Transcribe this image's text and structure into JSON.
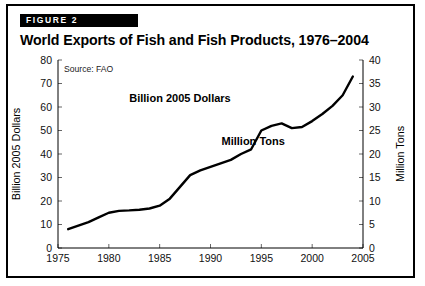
{
  "figure": {
    "badge": "FIGURE 2",
    "title": "World Exports of Fish and Fish Products, 1976–2004",
    "source": "Source: FAO"
  },
  "chart_data": {
    "type": "line",
    "title": "World Exports of Fish and Fish Products, 1976–2004",
    "subtitle": "Source: FAO",
    "xlabel": "",
    "ylabel": "Billion 2005 Dollars",
    "y2label": "Million Tons",
    "xlim": [
      1975,
      2005
    ],
    "ylim": [
      0,
      80
    ],
    "y2lim": [
      0,
      40
    ],
    "xticks": [
      1975,
      1980,
      1985,
      1990,
      1995,
      2000,
      2005
    ],
    "yticks": [
      0,
      10,
      20,
      30,
      40,
      50,
      60,
      70,
      80
    ],
    "y2ticks": [
      0,
      5,
      10,
      15,
      20,
      25,
      30,
      35,
      40
    ],
    "grid": false,
    "legend": "none",
    "annotations": [
      {
        "text": "Billion 2005 Dollars",
        "x": 1987.0,
        "y": 62.0
      },
      {
        "text": "Million Tons",
        "x": 1994.2,
        "y": 44.0
      }
    ],
    "series": [
      {
        "name": "World exports of fish and fish products",
        "units": "Billion 2005 Dollars",
        "x": [
          1976,
          1977,
          1978,
          1979,
          1980,
          1981,
          1982,
          1983,
          1984,
          1985,
          1986,
          1987,
          1988,
          1989,
          1990,
          1991,
          1992,
          1993,
          1994,
          1995,
          1996,
          1997,
          1998,
          1999,
          2000,
          2001,
          2002,
          2003,
          2004
        ],
        "values": [
          8.0,
          9.5,
          11.0,
          13.0,
          15.0,
          15.8,
          16.0,
          16.3,
          16.8,
          18.0,
          21.0,
          26.0,
          31.0,
          33.0,
          34.5,
          36.0,
          37.5,
          40.0,
          42.0,
          50.0,
          52.0,
          53.0,
          51.0,
          51.5,
          54.0,
          57.0,
          60.5,
          65.0,
          73.0
        ]
      }
    ]
  },
  "axes": {
    "left_title": "Billion 2005 Dollars",
    "right_title": "Million Tons"
  }
}
